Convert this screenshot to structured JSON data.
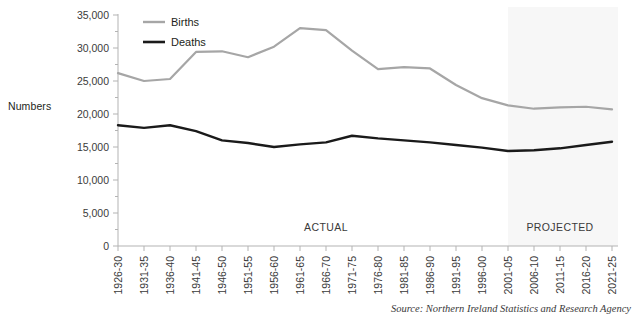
{
  "figure": {
    "y_axis_title": "Numbers",
    "source_note": "Source: Northern Ireland Statistics and Research Agency",
    "region_labels": {
      "actual": "ACTUAL",
      "projected": "PROJECTED"
    }
  },
  "colors": {
    "births_line": "#a6a6a6",
    "deaths_line": "#1a1a1a",
    "axis": "#b3b3b3",
    "text": "#231f20",
    "projected_band": "#f7f7f7",
    "background": "#ffffff"
  },
  "chart_data": {
    "type": "line",
    "title": "",
    "xlabel": "",
    "ylabel": "Numbers",
    "ylim": [
      0,
      35000
    ],
    "ytick_values": [
      0,
      5000,
      10000,
      15000,
      20000,
      25000,
      30000,
      35000
    ],
    "ytick_labels": [
      "0",
      "5,000",
      "10,000",
      "15,000",
      "20,000",
      "25,000",
      "30,000",
      "35,000"
    ],
    "minor_ytick_step": 2500,
    "grid": false,
    "legend_position": "top-left",
    "categories": [
      "1926-30",
      "1931-35",
      "1936-40",
      "1941-45",
      "1946-50",
      "1951-55",
      "1956-60",
      "1961-65",
      "1966-70",
      "1971-75",
      "1976-80",
      "1981-85",
      "1986-90",
      "1991-95",
      "1996-00",
      "2001-05",
      "2006-10",
      "2011-15",
      "2016-20",
      "2021-25"
    ],
    "series": [
      {
        "name": "Births",
        "color": "#a6a6a6",
        "values": [
          26200,
          25000,
          25300,
          29400,
          29500,
          28600,
          30200,
          33000,
          32700,
          29600,
          26800,
          27100,
          26900,
          24400,
          22400,
          21300,
          20800,
          21000,
          21100,
          20700
        ]
      },
      {
        "name": "Deaths",
        "color": "#1a1a1a",
        "values": [
          18300,
          17900,
          18300,
          17400,
          16000,
          15600,
          15000,
          15400,
          15700,
          16700,
          16300,
          16000,
          15700,
          15300,
          14900,
          14400,
          14500,
          14800,
          15300,
          15800
        ]
      }
    ],
    "annotations": [
      {
        "text": "ACTUAL",
        "category_index": 8,
        "kind": "region-label"
      },
      {
        "text": "PROJECTED",
        "category_index": 17,
        "kind": "region-label"
      }
    ],
    "projected_band": {
      "start_category": "2001-05",
      "end_category": "2021-25",
      "shaded": true
    }
  }
}
